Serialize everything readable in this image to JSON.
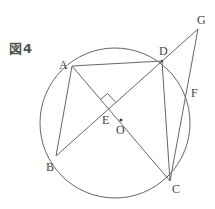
{
  "figure": {
    "title": "図4",
    "stroke_color": "#666666",
    "label_color": "#444444"
  },
  "circle": {
    "cx": 115,
    "cy": 123,
    "r": 75,
    "center_label": "O"
  },
  "points": {
    "A": {
      "label": "A",
      "x": 72,
      "y": 66
    },
    "B": {
      "label": "B",
      "x": 56,
      "y": 156
    },
    "C": {
      "label": "C",
      "x": 170,
      "y": 181
    },
    "D": {
      "label": "D",
      "x": 162,
      "y": 61
    },
    "E": {
      "label": "E",
      "x": 108,
      "y": 109
    },
    "F": {
      "label": "F",
      "x": 186,
      "y": 92
    },
    "G": {
      "label": "G",
      "x": 198,
      "y": 29
    },
    "O": {
      "label": "O",
      "x": 121,
      "y": 120
    }
  },
  "segments": [
    "AD",
    "AB",
    "AC",
    "BD",
    "DG",
    "DC",
    "GC"
  ],
  "annotations": {
    "right_angle_at": "E"
  }
}
